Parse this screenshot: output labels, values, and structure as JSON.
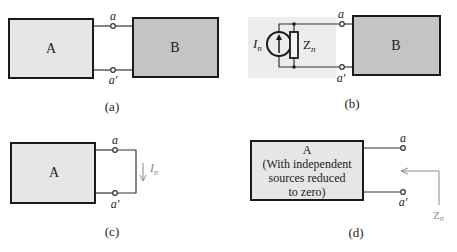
{
  "panels": {
    "a": {
      "caption": "(a)",
      "box_left_label": "A",
      "box_right_label": "B",
      "terminal_top": "a",
      "terminal_bottom": "a′"
    },
    "b": {
      "caption": "(b)",
      "source_label": "I",
      "source_sub": "n",
      "impedance_label": "Z",
      "impedance_sub": "n",
      "box_right_label": "B",
      "terminal_top": "a",
      "terminal_bottom": "a′"
    },
    "c": {
      "caption": "(c)",
      "box_label": "A",
      "terminal_top": "a",
      "terminal_bottom": "a′",
      "current_label": "I",
      "current_sub": "n"
    },
    "d": {
      "caption": "(d)",
      "box_lines": [
        "A",
        "(With independent",
        "sources reduced",
        "to zero)"
      ],
      "terminal_top": "a",
      "terminal_bottom": "a′",
      "impedance_label": "Z",
      "impedance_sub": "n"
    }
  },
  "colors": {
    "network_a_fill": "#e6e6e6",
    "network_b_fill": "#c4c4c4",
    "norton_bg": "#ececec",
    "annotation_gray": "#8a8a8a"
  }
}
